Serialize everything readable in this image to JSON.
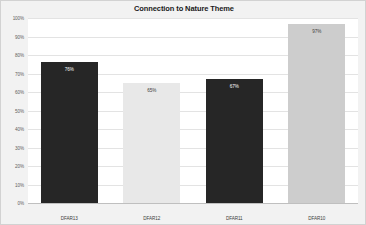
{
  "chart_data": {
    "type": "bar",
    "title": "Connection to Nature Theme",
    "xlabel": "",
    "ylabel": "",
    "categories": [
      "DFAR13",
      "DFAR12",
      "DFAR11",
      "DFAR10"
    ],
    "values": [
      76,
      65,
      67,
      97
    ],
    "data_labels": [
      "76%",
      "65%",
      "67%",
      "97%"
    ],
    "bar_colors": [
      "#262626",
      "#e8e8e8",
      "#262626",
      "#cdcdcd"
    ],
    "label_colors": [
      "#ffffff",
      "#3d3d3d",
      "#ffffff",
      "#3d3d3d"
    ],
    "ylim": [
      0,
      100
    ],
    "ytick_values": [
      100,
      90,
      80,
      70,
      60,
      50,
      40,
      30,
      20,
      10,
      0
    ],
    "ytick_labels": [
      "100%",
      "90%",
      "80%",
      "70%",
      "60%",
      "50%",
      "40%",
      "30%",
      "20%",
      "10%",
      "0%"
    ],
    "grid": true,
    "legend": "none",
    "plot_background": "#ffffff",
    "page_background": "#f2f2f2",
    "gridline_color": "#e3e3e3"
  }
}
